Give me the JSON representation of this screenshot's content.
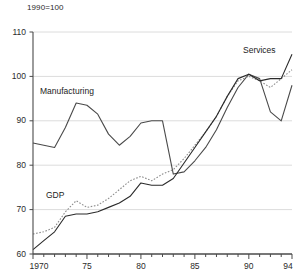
{
  "chart_data": {
    "type": "line",
    "title": "",
    "subtitle": "",
    "index_note": "1990=100",
    "xlabel": "",
    "ylabel": "",
    "xlim": [
      1970,
      1994
    ],
    "ylim": [
      60,
      110
    ],
    "yticks": [
      60,
      70,
      80,
      90,
      100,
      110
    ],
    "ytick_labels": [
      "60",
      "70",
      "80",
      "90",
      "100",
      "110"
    ],
    "xticks": [
      1970,
      1975,
      1980,
      1985,
      1990,
      1994
    ],
    "xtick_labels": [
      "1970",
      "75",
      "80",
      "85",
      "90",
      "94"
    ],
    "minor_xticks_every": 1,
    "grid": "horizontal",
    "legend_position": "inline-annotations",
    "x": [
      1970,
      1971,
      1972,
      1973,
      1974,
      1975,
      1976,
      1977,
      1978,
      1979,
      1980,
      1981,
      1982,
      1983,
      1984,
      1985,
      1986,
      1987,
      1988,
      1989,
      1990,
      1991,
      1992,
      1993,
      1994
    ],
    "series": [
      {
        "name": "Manufacturing",
        "style": "solid",
        "color": "#4a4a4a",
        "values": [
          85.0,
          84.5,
          84.0,
          88.5,
          94.0,
          93.5,
          91.5,
          87.0,
          84.5,
          86.5,
          89.5,
          90.0,
          90.0,
          78.0,
          78.5,
          81.0,
          84.0,
          88.0,
          93.0,
          97.5,
          100.5,
          99.5,
          92.0,
          90.0,
          98.0
        ]
      },
      {
        "name": "GDP",
        "style": "dotted",
        "color": "#8c8c8c",
        "values": [
          64.5,
          65.0,
          66.0,
          69.5,
          72.0,
          70.5,
          71.0,
          72.5,
          74.5,
          76.5,
          77.5,
          76.5,
          78.0,
          79.0,
          81.5,
          84.5,
          87.5,
          91.0,
          95.5,
          99.0,
          100.0,
          99.0,
          97.5,
          99.5,
          101.5
        ]
      },
      {
        "name": "Services",
        "style": "solid",
        "color": "#2a2a2a",
        "values": [
          61.0,
          63.0,
          65.0,
          68.5,
          69.0,
          69.0,
          69.5,
          70.5,
          71.5,
          73.0,
          76.0,
          75.5,
          75.5,
          77.0,
          80.5,
          84.0,
          87.5,
          91.0,
          95.5,
          99.5,
          100.5,
          99.0,
          99.5,
          99.5,
          105.0
        ]
      }
    ],
    "annotations": [
      {
        "text": "Manufacturing",
        "x_px": 40,
        "y_px": 86
      },
      {
        "text": "GDP",
        "x_px": 46,
        "y_px": 190
      },
      {
        "text": "Services",
        "x_px": 243,
        "y_px": 45
      }
    ]
  }
}
